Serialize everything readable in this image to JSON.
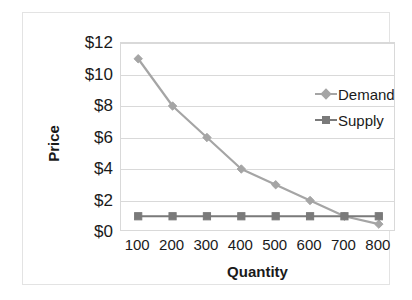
{
  "chart_data": {
    "type": "line",
    "title": "",
    "xlabel": "Quantity",
    "ylabel": "Price",
    "categories": [
      "100",
      "200",
      "300",
      "400",
      "500",
      "600",
      "700",
      "800"
    ],
    "x": [
      100,
      200,
      300,
      400,
      500,
      600,
      700,
      800
    ],
    "ylim": [
      0,
      12
    ],
    "ytick_values": [
      0,
      2,
      4,
      6,
      8,
      10,
      12
    ],
    "ytick_labels": [
      "$0",
      "$2",
      "$4",
      "$6",
      "$8",
      "$10",
      "$12"
    ],
    "grid": "horizontal",
    "legend_position": "inside-right-upper",
    "series": [
      {
        "name": "Demand",
        "color": "#a5a5a5",
        "marker": "diamond",
        "values": [
          11,
          8,
          6,
          4,
          3,
          2,
          1,
          0.5
        ]
      },
      {
        "name": "Supply",
        "color": "#7a7a7a",
        "marker": "square",
        "values": [
          1,
          1,
          1,
          1,
          1,
          1,
          1,
          1
        ]
      }
    ]
  },
  "colors": {
    "demand": "#a5a5a5",
    "supply": "#7a7a7a",
    "gridline": "#d9d9d9",
    "frame": "#e3e3e3",
    "text": "#1a1a1a",
    "background": "#ffffff"
  }
}
